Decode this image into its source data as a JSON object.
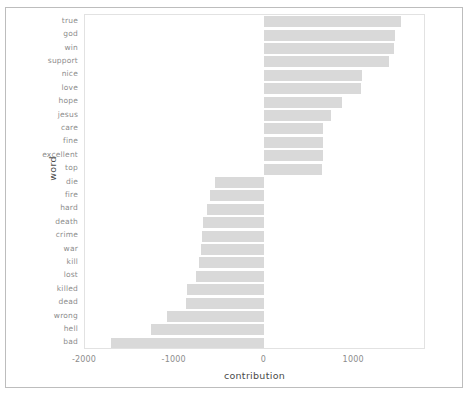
{
  "figure": {
    "background_color": "#ffffff",
    "panel_border_color": "#e2e2e2",
    "bar_color": "#d9d9d9",
    "axis_text_color": "#8c8c8c",
    "axis_title_color": "#4a4a4a"
  },
  "axes": {
    "x_title": "contribution",
    "y_title": "word",
    "x_ticks": [
      "-2000",
      "-1000",
      "0",
      "1000"
    ],
    "x_tick_values": [
      -2000,
      -1000,
      0,
      1000
    ]
  },
  "chart_data": {
    "type": "bar",
    "orientation": "horizontal",
    "title": "",
    "xlabel": "contribution",
    "ylabel": "word",
    "xlim": [
      -2000,
      1800
    ],
    "grid": false,
    "legend": "none",
    "categories": [
      "true",
      "god",
      "win",
      "support",
      "nice",
      "love",
      "hope",
      "jesus",
      "care",
      "fine",
      "excellent",
      "top",
      "die",
      "fire",
      "hard",
      "death",
      "crime",
      "war",
      "kill",
      "lost",
      "killed",
      "dead",
      "wrong",
      "hell",
      "bad"
    ],
    "values": [
      1520,
      1460,
      1440,
      1390,
      1090,
      1080,
      860,
      745,
      650,
      650,
      650,
      640,
      -550,
      -610,
      -640,
      -690,
      -700,
      -710,
      -730,
      -760,
      -860,
      -870,
      -1090,
      -1270,
      -1710
    ],
    "series": [
      {
        "name": "contribution",
        "values": [
          1520,
          1460,
          1440,
          1390,
          1090,
          1080,
          860,
          745,
          650,
          650,
          650,
          640,
          -550,
          -610,
          -640,
          -690,
          -700,
          -710,
          -730,
          -760,
          -860,
          -870,
          -1090,
          -1270,
          -1710
        ]
      }
    ]
  }
}
